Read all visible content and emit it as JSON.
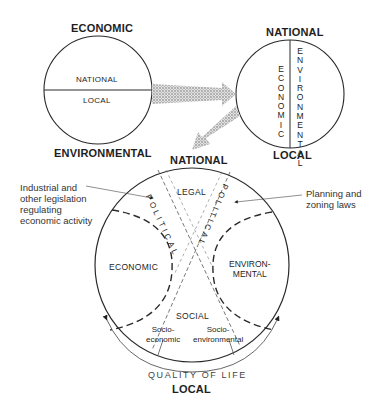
{
  "diagram": {
    "circle_left": {
      "top_label": "ECONOMIC",
      "bottom_label": "ENVIRONMENTAL",
      "upper_half": "NATIONAL",
      "lower_half": "LOCAL"
    },
    "circle_right": {
      "top_label": "NATIONAL",
      "bottom_label": "LOCAL",
      "left_half": "ECONOMIC",
      "right_half": "ENVIRONMENTAL"
    },
    "circle_main": {
      "top_label": "NATIONAL",
      "bottom_label": "LOCAL",
      "regions": {
        "legal": "LEGAL",
        "economic": "ECONOMIC",
        "environmental": "ENVIRON-\nMENTAL",
        "social": "SOCIAL",
        "socio_economic": "Socio-\neconomic",
        "socio_environmental": "Socio-\nenvironmental"
      },
      "political_left": "POLITICAL",
      "political_right": "POLITICAL",
      "arc_label": "QUALITY OF LIFE"
    },
    "annotations": {
      "left": "Industrial and\nother legislation\nregulating\neconomic activity",
      "right": "Planning and\nzoning laws"
    },
    "colors": {
      "line": "#2a2a2a",
      "arrow_fill": "#c8c8c8",
      "background": "#ffffff"
    }
  }
}
